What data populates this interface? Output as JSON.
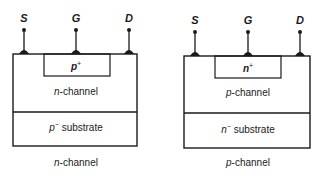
{
  "diagram": {
    "type": "JFET cross-section comparison",
    "devices": [
      {
        "id": "left",
        "terminals": [
          {
            "label": "S",
            "x": 24
          },
          {
            "label": "G",
            "x": 76
          },
          {
            "label": "D",
            "x": 129
          }
        ],
        "gate_region": {
          "base": "p",
          "sup": "+"
        },
        "channel_region": {
          "italic": "n",
          "rest": "-channel"
        },
        "substrate_region": {
          "base": "p",
          "sup": "−",
          "rest": " substrate"
        },
        "caption": {
          "italic": "n",
          "rest": "-channel"
        }
      },
      {
        "id": "right",
        "terminals": [
          {
            "label": "S",
            "x": 195
          },
          {
            "label": "G",
            "x": 248
          },
          {
            "label": "D",
            "x": 300
          }
        ],
        "gate_region": {
          "base": "n",
          "sup": "+"
        },
        "channel_region": {
          "italic": "p",
          "rest": "-channel"
        },
        "substrate_region": {
          "base": "n",
          "sup": "−",
          "rest": " substrate"
        },
        "caption": {
          "italic": "p",
          "rest": "-channel"
        }
      }
    ],
    "colors": {
      "stroke": "#1a1a1a",
      "background": "#ffffff"
    }
  }
}
